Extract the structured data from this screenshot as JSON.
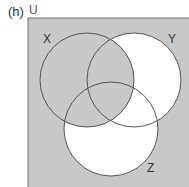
{
  "question_label": "(h)",
  "universe_label": "U",
  "sets": [
    {
      "name": "X",
      "cx": 87,
      "cy": 80,
      "r": 47
    },
    {
      "name": "Y",
      "cx": 134,
      "cy": 80,
      "r": 47
    },
    {
      "name": "Z",
      "cx": 111,
      "cy": 129,
      "r": 47
    }
  ],
  "shaded_region": "X ∪ (Y ∪ Z)'",
  "colors": {
    "shade": "#c8c8c8",
    "unshaded": "#ffffff",
    "outline": "#555555"
  }
}
